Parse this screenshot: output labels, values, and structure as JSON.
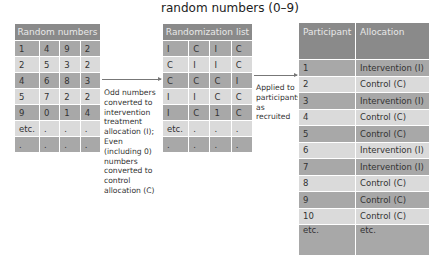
{
  "title": "random numbers (0–9)",
  "random_numbers": {
    "header": "Random numbers",
    "rows": [
      [
        "1",
        "4",
        "9",
        "2"
      ],
      [
        "2",
        "5",
        "3",
        "2"
      ],
      [
        "4",
        "6",
        "8",
        "3"
      ],
      [
        "5",
        "7",
        "2",
        "2"
      ],
      [
        "9",
        "0",
        "1",
        "4"
      ],
      [
        "etc.",
        ".",
        ".",
        "."
      ],
      [
        ".",
        ".",
        ".",
        "."
      ]
    ]
  },
  "conversion_note": "Odd numbers converted to intervention treatment allocation (I); Even (including 0) numbers converted to control allocation (C)",
  "randomization_list": {
    "header": "Randomization list",
    "rows": [
      [
        "I",
        "C",
        "I",
        "C"
      ],
      [
        "C",
        "I",
        "I",
        "C"
      ],
      [
        "C",
        "C",
        "C",
        "I"
      ],
      [
        "I",
        "I",
        "C",
        "C"
      ],
      [
        "I",
        "C",
        "1",
        "C"
      ],
      [
        "etc.",
        ".",
        ".",
        "."
      ],
      [
        ".",
        ".",
        ".",
        "."
      ]
    ]
  },
  "applied_note": "Applied to participants as recruited",
  "allocation_table": {
    "headers": [
      "Participant",
      "Allocation"
    ],
    "rows": [
      [
        "1",
        "Intervention (I)"
      ],
      [
        "2",
        "Control (C)"
      ],
      [
        "3",
        "Intervention (I)"
      ],
      [
        "4",
        "Control (C)"
      ],
      [
        "5",
        "Control (C)"
      ],
      [
        "6",
        "Intervention (I)"
      ],
      [
        "7",
        "Intervention (I)"
      ],
      [
        "8",
        "Control (C)"
      ],
      [
        "9",
        "Control (C)"
      ],
      [
        "10",
        "Control (C)"
      ],
      [
        "etc.",
        "etc."
      ]
    ]
  },
  "colors": {
    "header": "#8a8a8a",
    "row_dark": "#a8a8a8",
    "row_light": "#dadada",
    "arrow": "#777777"
  }
}
